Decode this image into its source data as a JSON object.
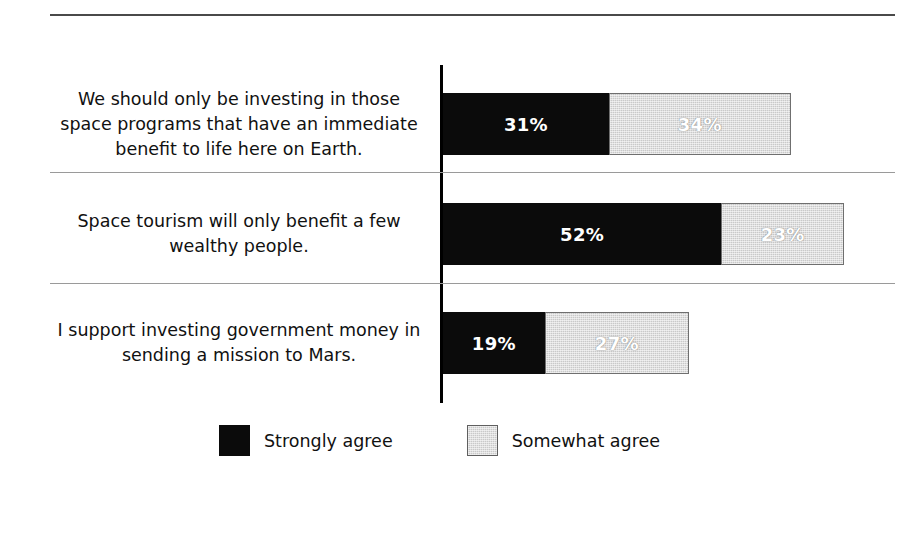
{
  "chart_data": {
    "type": "bar",
    "orientation": "horizontal",
    "stacked": true,
    "title": "",
    "subtitle": "",
    "xlabel": "",
    "ylabel": "",
    "grid": false,
    "legend_position": "bottom-left",
    "value_suffix": "%",
    "axis_origin_percent": 0,
    "pixels_per_percent": 5.35,
    "categories": [
      "We should only be investing in those\nspace programs that have an immediate\nbenefit to life here on Earth.",
      "Space tourism will only benefit a few\nwealthy people.",
      "I support investing government money in\nsending a mission to Mars."
    ],
    "series": [
      {
        "name": "Strongly agree",
        "color": "#0b0b0b",
        "values": [
          31,
          52,
          19
        ],
        "labels": [
          "31%",
          "52%",
          "19%"
        ]
      },
      {
        "name": "Somewhat agree",
        "color": "#c9c9c9",
        "values": [
          34,
          23,
          27
        ],
        "labels": [
          "34%",
          "23%",
          "27%"
        ]
      }
    ],
    "totals": [
      65,
      75,
      46
    ],
    "legend": [
      {
        "label": "Strongly agree",
        "swatch": "#0b0b0b"
      },
      {
        "label": "Somewhat agree",
        "swatch": "#c9c9c9"
      }
    ]
  },
  "rows": [
    {
      "label": "We should only be investing in those\nspace programs that have an immediate\nbenefit to life here on Earth.",
      "strongly": {
        "value": 31,
        "label": "31%"
      },
      "somewhat": {
        "value": 34,
        "label": "34%"
      }
    },
    {
      "label": "Space tourism will only benefit a few\nwealthy people.",
      "strongly": {
        "value": 52,
        "label": "52%"
      },
      "somewhat": {
        "value": 23,
        "label": "23%"
      }
    },
    {
      "label": "I support investing government money in\nsending a mission to Mars.",
      "strongly": {
        "value": 19,
        "label": "19%"
      },
      "somewhat": {
        "value": 27,
        "label": "27%"
      }
    }
  ],
  "legend": {
    "strongly_label": "Strongly agree",
    "somewhat_label": "Somewhat agree"
  },
  "colors": {
    "strongly_agree": "#0b0b0b",
    "somewhat_agree": "#c9c9c9",
    "axis": "#000000",
    "separator": "#9a9a9a",
    "top_rule": "#4a4a4a",
    "background": "#ffffff",
    "text": "#111111"
  }
}
